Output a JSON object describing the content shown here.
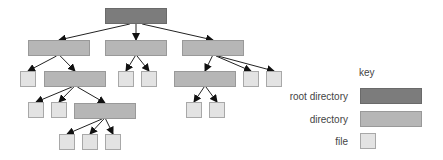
{
  "diagram": {
    "type": "directory-tree",
    "colors": {
      "root": "#7c7c7c",
      "directory": "#b6b6b6",
      "file": "#e3e3e3",
      "edge": "#222222"
    },
    "nodes": [
      {
        "id": "root",
        "kind": "root",
        "x": 105,
        "y": 8,
        "w": 62,
        "h": 16
      },
      {
        "id": "d1",
        "kind": "directory",
        "x": 28,
        "y": 40,
        "w": 62,
        "h": 16
      },
      {
        "id": "d2",
        "kind": "directory",
        "x": 105,
        "y": 40,
        "w": 62,
        "h": 16
      },
      {
        "id": "d3",
        "kind": "directory",
        "x": 182,
        "y": 40,
        "w": 62,
        "h": 16
      },
      {
        "id": "f1",
        "kind": "file",
        "x": 20,
        "y": 71,
        "w": 16,
        "h": 16
      },
      {
        "id": "d11",
        "kind": "directory",
        "x": 44,
        "y": 71,
        "w": 62,
        "h": 16
      },
      {
        "id": "f2",
        "kind": "file",
        "x": 118,
        "y": 71,
        "w": 16,
        "h": 16
      },
      {
        "id": "f3",
        "kind": "file",
        "x": 141,
        "y": 71,
        "w": 16,
        "h": 16
      },
      {
        "id": "d31",
        "kind": "directory",
        "x": 174,
        "y": 71,
        "w": 62,
        "h": 16
      },
      {
        "id": "f4",
        "kind": "file",
        "x": 243,
        "y": 71,
        "w": 16,
        "h": 16
      },
      {
        "id": "f5",
        "kind": "file",
        "x": 266,
        "y": 71,
        "w": 16,
        "h": 16
      },
      {
        "id": "f6",
        "kind": "file",
        "x": 28,
        "y": 102,
        "w": 16,
        "h": 16
      },
      {
        "id": "f7",
        "kind": "file",
        "x": 51,
        "y": 102,
        "w": 16,
        "h": 16
      },
      {
        "id": "d111",
        "kind": "directory",
        "x": 74,
        "y": 103,
        "w": 62,
        "h": 16
      },
      {
        "id": "f8",
        "kind": "file",
        "x": 186,
        "y": 102,
        "w": 16,
        "h": 16
      },
      {
        "id": "f9",
        "kind": "file",
        "x": 209,
        "y": 102,
        "w": 16,
        "h": 16
      },
      {
        "id": "f10",
        "kind": "file",
        "x": 59,
        "y": 134,
        "w": 16,
        "h": 16
      },
      {
        "id": "f11",
        "kind": "file",
        "x": 82,
        "y": 134,
        "w": 16,
        "h": 16
      },
      {
        "id": "f12",
        "kind": "file",
        "x": 105,
        "y": 134,
        "w": 16,
        "h": 16
      }
    ],
    "edges": [
      [
        "root",
        "d1"
      ],
      [
        "root",
        "d2"
      ],
      [
        "root",
        "d3"
      ],
      [
        "d1",
        "f1"
      ],
      [
        "d1",
        "d11"
      ],
      [
        "d2",
        "f2"
      ],
      [
        "d2",
        "f3"
      ],
      [
        "d3",
        "d31"
      ],
      [
        "d3",
        "f4"
      ],
      [
        "d3",
        "f5"
      ],
      [
        "d11",
        "f6"
      ],
      [
        "d11",
        "f7"
      ],
      [
        "d11",
        "d111"
      ],
      [
        "d31",
        "f8"
      ],
      [
        "d31",
        "f9"
      ],
      [
        "d111",
        "f10"
      ],
      [
        "d111",
        "f11"
      ],
      [
        "d111",
        "f12"
      ]
    ]
  },
  "key": {
    "title": "key",
    "items": [
      {
        "label": "root directory",
        "kind": "root"
      },
      {
        "label": "directory",
        "kind": "directory"
      },
      {
        "label": "file",
        "kind": "file"
      }
    ]
  }
}
